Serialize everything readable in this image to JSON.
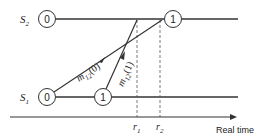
{
  "diagram": {
    "processes": [
      {
        "id": "S2",
        "label_base": "S",
        "label_sub": "2",
        "y": 19,
        "events": [
          {
            "label": "0",
            "x": 47
          },
          {
            "label": "1",
            "x": 173
          }
        ]
      },
      {
        "id": "S1",
        "label_base": "S",
        "label_sub": "1",
        "y": 97,
        "events": [
          {
            "label": "0",
            "x": 47
          },
          {
            "label": "1",
            "x": 103
          }
        ]
      }
    ],
    "messages": [
      {
        "label_base": "m",
        "label_sub": "12",
        "label_arg": "(0)"
      },
      {
        "label_base": "m",
        "label_sub": "12",
        "label_arg": "(1)"
      }
    ],
    "time_marks": [
      {
        "label_base": "r",
        "label_sub": "1",
        "x": 137
      },
      {
        "label_base": "r",
        "label_sub": "2",
        "x": 160
      }
    ],
    "axis": {
      "label": "Real time"
    },
    "colors": {
      "line": "#333333",
      "dashed": "#555555",
      "background": "#ffffff"
    }
  }
}
